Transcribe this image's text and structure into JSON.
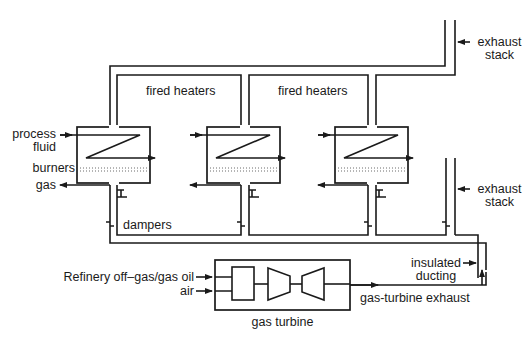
{
  "diagram": {
    "labels": {
      "process_fluid_1": "process",
      "process_fluid_2": "fluid",
      "burners": "burners",
      "gas": "gas",
      "dampers": "dampers",
      "fired_heaters_1": "fired heaters",
      "fired_heaters_2": "fired heaters",
      "exhaust_stack_top_1": "exhaust",
      "exhaust_stack_top_2": "stack",
      "exhaust_stack_bottom_1": "exhaust",
      "exhaust_stack_bottom_2": "stack",
      "insulated_ducting_1": "insulated",
      "insulated_ducting_2": "ducting",
      "refinery_fuel": "Refinery off–gas/gas oil",
      "air": "air",
      "gas_turbine": "gas turbine",
      "gas_turbine_exhaust": "gas-turbine exhaust"
    },
    "components": [
      "fired heater 1",
      "fired heater 2",
      "fired heater 3",
      "exhaust stack (upper)",
      "exhaust stack (lower)",
      "gas turbine",
      "insulated ducting",
      "dampers"
    ],
    "colors": {
      "line": "#1a1a1a",
      "background": "#ffffff"
    }
  }
}
